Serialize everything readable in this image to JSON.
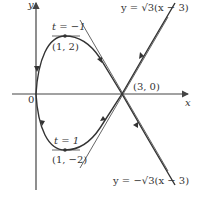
{
  "figure": {
    "axes": {
      "x_label": "x",
      "y_label": "y",
      "origin_label": "0"
    },
    "points": [
      {
        "label": "(1, 2)",
        "param_label": "t = −1",
        "x": 1,
        "y": 2
      },
      {
        "label": "(1, −2)",
        "param_label": "t = 1",
        "x": 1,
        "y": -2
      },
      {
        "label": "(3, 0)",
        "x": 3,
        "y": 0
      }
    ],
    "tangent_lines": [
      {
        "label": "y = √3(x − 3)",
        "slope": "sqrt(3)"
      },
      {
        "label": "y = −√3(x − 3)",
        "slope": "-sqrt(3)"
      }
    ],
    "curve": "parametric loop through origin, (1,2), (3,0), (1,-2) with direction arrows",
    "colors": {
      "curve": "#333333",
      "axes": "#444444",
      "tangent": "#666666",
      "text": "#333333"
    }
  }
}
